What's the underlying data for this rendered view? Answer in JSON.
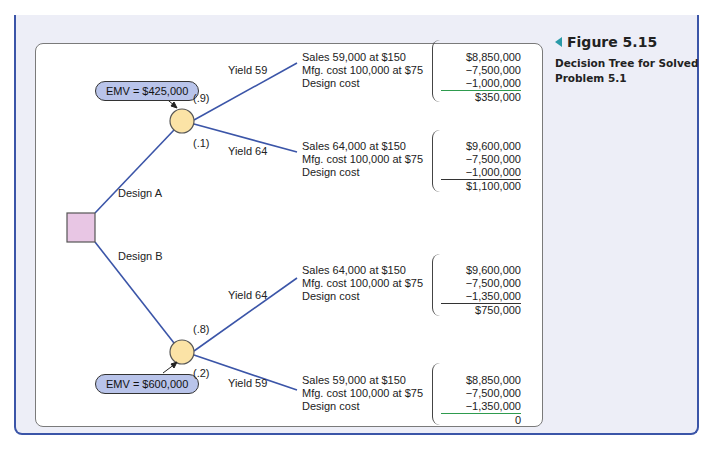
{
  "figure": {
    "number": "Figure 5.15",
    "caption": "Decision Tree for Solved Problem 5.1"
  },
  "tree": {
    "decision_node": {
      "shape": "square",
      "color": "#e8c6e4"
    },
    "branches": [
      {
        "label": "Design A",
        "emv": "EMV = $425,000",
        "outcomes": [
          {
            "probability": "(.9)",
            "label": "Yield 59",
            "lines": [
              "Sales 59,000 at $150",
              "Mfg. cost 100,000 at $75",
              "Design cost"
            ],
            "values": [
              "$8,850,000",
              "−7,500,000",
              "−1,000,000"
            ],
            "total": "$350,000"
          },
          {
            "probability": "(.1)",
            "label": "Yield 64",
            "lines": [
              "Sales 64,000 at $150",
              "Mfg. cost 100,000 at $75",
              "Design cost"
            ],
            "values": [
              "$9,600,000",
              "−7,500,000",
              "−1,000,000"
            ],
            "total": "$1,100,000"
          }
        ]
      },
      {
        "label": "Design B",
        "emv": "EMV = $600,000",
        "outcomes": [
          {
            "probability": "(.8)",
            "label": "Yield 64",
            "lines": [
              "Sales 64,000 at $150",
              "Mfg. cost 100,000 at $75",
              "Design cost"
            ],
            "values": [
              "$9,600,000",
              "−7,500,000",
              "−1,350,000"
            ],
            "total": "$750,000"
          },
          {
            "probability": "(.2)",
            "label": "Yield 59",
            "lines": [
              "Sales 59,000 at $150",
              "Mfg. cost 100,000 at $75",
              "Design cost"
            ],
            "values": [
              "$8,850,000",
              "−7,500,000",
              "−1,350,000"
            ],
            "total": "0"
          }
        ]
      }
    ]
  },
  "colors": {
    "branch_line": "#3b55a8",
    "chance_node": "#fbe3a6",
    "emv_bubble": "#b9c4ea",
    "frame": "#3b55a8",
    "caption_arrow": "#2a9aa8"
  }
}
